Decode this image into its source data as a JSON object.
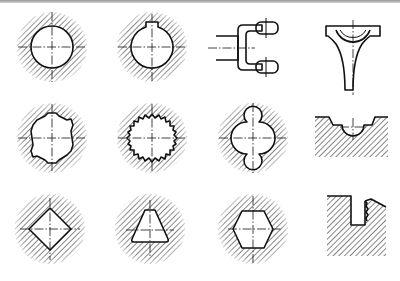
{
  "figure": {
    "rows": 3,
    "cols": 4,
    "colors": {
      "line": "#111111",
      "background": "#ffffff",
      "border": "#9a9a9a"
    },
    "items": [
      {
        "row": 0,
        "col": 0,
        "name": "round-hole-section",
        "label": ""
      },
      {
        "row": 0,
        "col": 1,
        "name": "keyway-hole-section",
        "label": ""
      },
      {
        "row": 0,
        "col": 2,
        "name": "fork-yoke",
        "label": ""
      },
      {
        "row": 0,
        "col": 3,
        "name": "shifter-fork",
        "label": ""
      },
      {
        "row": 1,
        "col": 0,
        "name": "spline-hole-section",
        "label": ""
      },
      {
        "row": 1,
        "col": 1,
        "name": "serrated-hole-section",
        "label": ""
      },
      {
        "row": 1,
        "col": 2,
        "name": "multi-arc-hole-section",
        "label": ""
      },
      {
        "row": 1,
        "col": 3,
        "name": "semicircular-groove-block",
        "label": ""
      },
      {
        "row": 2,
        "col": 0,
        "name": "square-hole-section",
        "label": ""
      },
      {
        "row": 2,
        "col": 1,
        "name": "triangular-hole-section",
        "label": ""
      },
      {
        "row": 2,
        "col": 2,
        "name": "hexagonal-hole-section",
        "label": ""
      },
      {
        "row": 2,
        "col": 3,
        "name": "stepped-slot-block",
        "label": ""
      }
    ]
  }
}
